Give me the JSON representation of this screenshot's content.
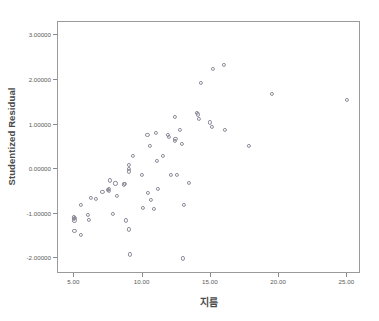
{
  "chart_data": {
    "type": "scatter",
    "title": "",
    "xlabel": "지름",
    "ylabel": "Studentized Residual",
    "xlim": [
      3.8,
      26.0
    ],
    "ylim": [
      -2.35,
      3.3
    ],
    "grid": false,
    "legend": null,
    "xticks": [
      "5.00",
      "10.00",
      "15.00",
      "20.00",
      "25.00"
    ],
    "xtick_values": [
      5,
      10,
      15,
      20,
      25
    ],
    "yticks": [
      "3.00000",
      "2.00000",
      "1.00000",
      "0.00000",
      "-1.00000",
      "-2.00000"
    ],
    "ytick_values": [
      3,
      2,
      1,
      0,
      -1,
      -2
    ],
    "marker": "open-circle",
    "marker_color": "#8c8c9a",
    "points": [
      [
        4.95,
        -1.08
      ],
      [
        4.95,
        -1.12
      ],
      [
        5.0,
        -1.15
      ],
      [
        5.05,
        -1.1
      ],
      [
        5.0,
        -1.38
      ],
      [
        5.5,
        -1.48
      ],
      [
        5.45,
        -0.8
      ],
      [
        6.0,
        -1.02
      ],
      [
        6.05,
        -1.13
      ],
      [
        6.2,
        -0.65
      ],
      [
        6.6,
        -0.67
      ],
      [
        7.05,
        -0.51
      ],
      [
        7.45,
        -0.47
      ],
      [
        7.5,
        -0.49
      ],
      [
        7.5,
        -0.45
      ],
      [
        7.6,
        -0.25
      ],
      [
        7.8,
        -1.0
      ],
      [
        8.0,
        -0.32
      ],
      [
        8.1,
        -0.59
      ],
      [
        8.6,
        -0.34
      ],
      [
        8.7,
        -0.33
      ],
      [
        8.75,
        -1.15
      ],
      [
        9.0,
        0.09
      ],
      [
        9.0,
        0.0
      ],
      [
        9.0,
        -0.05
      ],
      [
        9.0,
        -1.35
      ],
      [
        9.05,
        -1.91
      ],
      [
        9.3,
        0.3
      ],
      [
        9.95,
        -0.12
      ],
      [
        10.0,
        -0.86
      ],
      [
        10.35,
        0.77
      ],
      [
        10.4,
        -0.54
      ],
      [
        10.55,
        0.53
      ],
      [
        10.6,
        -0.69
      ],
      [
        10.85,
        -0.89
      ],
      [
        11.0,
        0.81
      ],
      [
        11.05,
        0.19
      ],
      [
        11.1,
        -0.45
      ],
      [
        11.5,
        0.3
      ],
      [
        11.85,
        0.76
      ],
      [
        11.9,
        0.72
      ],
      [
        12.1,
        -0.12
      ],
      [
        12.35,
        0.64
      ],
      [
        12.4,
        0.67
      ],
      [
        12.35,
        1.17
      ],
      [
        12.5,
        -0.12
      ],
      [
        12.75,
        0.88
      ],
      [
        12.9,
        0.56
      ],
      [
        12.95,
        -2.0
      ],
      [
        13.0,
        -0.8
      ],
      [
        13.4,
        -0.3
      ],
      [
        14.0,
        1.27
      ],
      [
        14.05,
        1.23
      ],
      [
        14.1,
        1.12
      ],
      [
        14.25,
        1.94
      ],
      [
        14.95,
        1.05
      ],
      [
        15.15,
        2.25
      ],
      [
        15.1,
        0.94
      ],
      [
        15.95,
        2.34
      ],
      [
        16.0,
        0.88
      ],
      [
        17.8,
        0.53
      ],
      [
        19.5,
        1.69
      ],
      [
        24.95,
        1.55
      ]
    ]
  },
  "axes": {
    "y_title": "Studentized Residual",
    "x_title": "지름"
  }
}
